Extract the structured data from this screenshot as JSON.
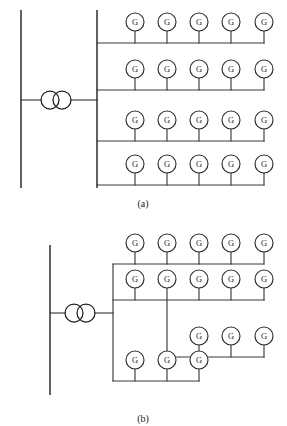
{
  "figure": {
    "canvas": {
      "width": 287,
      "height": 426
    },
    "stroke_color": "#3a3a3a",
    "bus_color": "#2e2e2e",
    "background_color": "#ffffff",
    "generator_label": "G"
  },
  "subfigures": [
    {
      "id": "a",
      "caption": "(a)",
      "caption_pos": {
        "x": 143,
        "y": 204
      },
      "description": "Radial collector: four parallel feeders tapped off a single collector bus, five generators per feeder",
      "utility_bus": {
        "x": 21,
        "y1": 10,
        "y2": 188
      },
      "tie_line": {
        "x1": 21,
        "y1": 100,
        "x2": 97,
        "y2": 100
      },
      "transformer": {
        "cx1": 50,
        "cx2": 62,
        "cy": 100,
        "r": 9,
        "name": "two-winding-transformer"
      },
      "collector_bus": {
        "x": 97,
        "y1": 10,
        "y2": 188
      },
      "feeders": [
        {
          "index": 1,
          "y": 43,
          "x_start": 97,
          "x_end": 264,
          "gen_row_cy": 22
        },
        {
          "index": 2,
          "y": 90,
          "x_start": 97,
          "x_end": 264,
          "gen_row_cy": 69
        },
        {
          "index": 3,
          "y": 141,
          "x_start": 97,
          "x_end": 264,
          "gen_row_cy": 120
        },
        {
          "index": 4,
          "y": 185,
          "x_start": 97,
          "x_end": 264,
          "gen_row_cy": 164
        }
      ],
      "generator_xs": [
        135,
        167,
        199,
        231,
        264
      ],
      "generator_radius": 9,
      "generator_count": 20
    },
    {
      "id": "b",
      "caption": "(b)",
      "caption_pos": {
        "x": 143,
        "y": 419
      },
      "description": "Looped/branched collector: tiered feeder branches, uneven generator counts per branch",
      "utility_bus": {
        "x": 50,
        "y1": 245,
        "y2": 395
      },
      "tie_line": {
        "x1": 50,
        "y1": 313,
        "x2": 113,
        "y2": 313
      },
      "transformer": {
        "cx1": 74,
        "cx2": 86,
        "cy": 313,
        "r": 9,
        "name": "two-winding-transformer"
      },
      "riser": {
        "x": 113,
        "y1": 264,
        "y2": 381
      },
      "branches": [
        {
          "index": 1,
          "y": 264,
          "x_start": 113,
          "x_end": 264,
          "gen_row_cy": 243,
          "generator_xs": [
            135,
            167,
            199,
            231,
            264
          ],
          "generator_count": 5
        },
        {
          "index": 2,
          "y": 300,
          "x_start": 113,
          "x_end": 264,
          "gen_row_cy": 279,
          "generator_xs": [
            135,
            167,
            199,
            231,
            264
          ],
          "generator_count": 5
        },
        {
          "index": 3,
          "y": 357,
          "x_start": 167,
          "x_end": 264,
          "gen_row_cy": 336,
          "generator_xs": [
            199,
            231,
            264
          ],
          "generator_count": 3,
          "note": "drops from the second generator stem of branch 2"
        },
        {
          "index": 4,
          "y": 381,
          "x_start": 113,
          "x_end": 199,
          "gen_row_cy": 360,
          "generator_xs": [
            135,
            167,
            199
          ],
          "generator_count": 3
        }
      ],
      "generator_radius": 9,
      "generator_count": 16
    }
  ]
}
